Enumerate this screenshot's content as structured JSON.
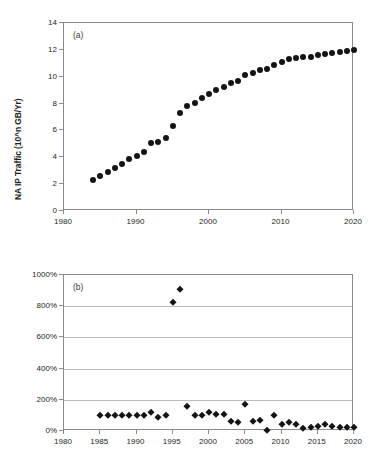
{
  "figure": {
    "panels": [
      {
        "tag": "(a)",
        "ylabel": "NA IP Traffic (10^n GB/Yr)"
      },
      {
        "tag": "(b)",
        "ylabel": "Annual Growth Rate of NA IP Traffic"
      }
    ]
  },
  "chart_data": [
    {
      "type": "scatter",
      "title": "",
      "panel": "(a)",
      "xlabel": "",
      "ylabel": "NA IP Traffic (10^n GB/Yr)",
      "xlim": [
        1980,
        2020
      ],
      "ylim": [
        0,
        14
      ],
      "xticks": [
        1980,
        1990,
        2000,
        2010,
        2020
      ],
      "xtick_labels": [
        "1980",
        "1990",
        "2000",
        "2010",
        "2020"
      ],
      "yticks": [
        0,
        2,
        4,
        6,
        8,
        10,
        12,
        14
      ],
      "ytick_labels": [
        "0",
        "2",
        "4",
        "6",
        "8",
        "10",
        "12",
        "14"
      ],
      "grid": false,
      "marker": "filled-circle",
      "marker_color": "#141414",
      "x": [
        1984,
        1985,
        1986,
        1987,
        1988,
        1989,
        1990,
        1991,
        1992,
        1993,
        1994,
        1995,
        1996,
        1997,
        1998,
        1999,
        2000,
        2001,
        2002,
        2003,
        2004,
        2005,
        2006,
        2007,
        2008,
        2009,
        2010,
        2011,
        2012,
        2013,
        2014,
        2015,
        2016,
        2017,
        2018,
        2019,
        2020
      ],
      "y": [
        2.3,
        2.6,
        2.9,
        3.2,
        3.5,
        3.85,
        4.1,
        4.4,
        5.1,
        5.15,
        5.4,
        6.3,
        7.3,
        7.8,
        8.05,
        8.4,
        8.7,
        9.0,
        9.25,
        9.5,
        9.65,
        10.1,
        10.3,
        10.5,
        10.55,
        10.9,
        11.1,
        11.3,
        11.4,
        11.45,
        11.5,
        11.6,
        11.7,
        11.8,
        11.85,
        11.95,
        12.0
      ]
    },
    {
      "type": "scatter",
      "title": "",
      "panel": "(b)",
      "xlabel": "",
      "ylabel": "Annual Growth Rate of NA IP Traffic",
      "xlim": [
        1980,
        2020
      ],
      "ylim": [
        0,
        1000
      ],
      "xticks": [
        1980,
        1985,
        1990,
        1995,
        2000,
        2005,
        2010,
        2015,
        2020
      ],
      "xtick_labels": [
        "1980",
        "1985",
        "1990",
        "1995",
        "2000",
        "2005",
        "2010",
        "2015",
        "2020"
      ],
      "yticks": [
        0,
        200,
        400,
        600,
        800,
        1000
      ],
      "ytick_labels": [
        "0%",
        "200%",
        "400%",
        "600%",
        "800%",
        "1000%"
      ],
      "grid": true,
      "marker": "filled-diamond",
      "marker_color": "#141414",
      "x": [
        1985,
        1986,
        1987,
        1988,
        1989,
        1990,
        1991,
        1992,
        1993,
        1994,
        1995,
        1996,
        1997,
        1998,
        1999,
        2000,
        2001,
        2002,
        2003,
        2004,
        2005,
        2006,
        2007,
        2008,
        2009,
        2010,
        2011,
        2012,
        2013,
        2014,
        2015,
        2016,
        2017,
        2018,
        2019,
        2020
      ],
      "y": [
        100,
        100,
        100,
        100,
        100,
        100,
        100,
        125,
        88,
        100,
        825,
        910,
        158,
        105,
        103,
        123,
        110,
        108,
        62,
        55,
        172,
        65,
        70,
        8,
        105,
        43,
        55,
        47,
        20,
        25,
        30,
        42,
        33,
        25,
        25,
        23
      ]
    }
  ]
}
